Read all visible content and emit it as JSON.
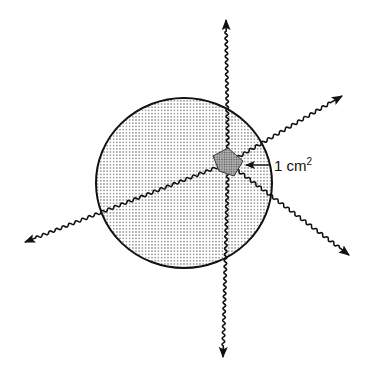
{
  "diagram": {
    "label_value": "1 cm",
    "label_exponent": "2",
    "elements": [
      "sphere",
      "unit-area-square",
      "wavy-ray-up",
      "wavy-ray-down",
      "wavy-ray-upper-right",
      "wavy-ray-lower-left",
      "wavy-ray-lower-right"
    ],
    "colors": {
      "stroke": "#111111",
      "fill_dots": "#888888",
      "square_fill": "#9a9a9a",
      "background": "#ffffff"
    }
  }
}
